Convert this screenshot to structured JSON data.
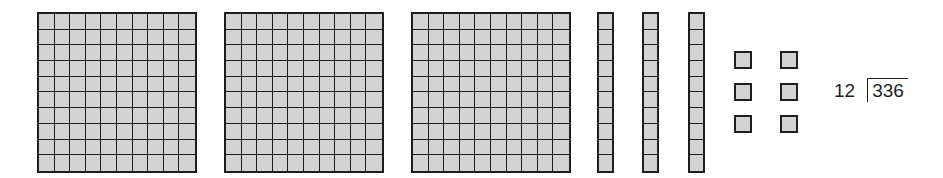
{
  "diagram": {
    "colors": {
      "block_fill": "#d3d3d3",
      "block_line": "#1e1e1e",
      "background": "#ffffff"
    },
    "base_ten_blocks": {
      "hundreds": {
        "count": 3,
        "grid": "10x10",
        "positions_x": [
          37,
          224,
          411
        ]
      },
      "tens": {
        "count": 3,
        "grid": "1x10",
        "positions_x": [
          597,
          642,
          688
        ]
      },
      "ones": {
        "count": 6,
        "layout": "3 rows x 2 columns",
        "positions": [
          {
            "x": 734,
            "y": 51
          },
          {
            "x": 780,
            "y": 51
          },
          {
            "x": 734,
            "y": 83
          },
          {
            "x": 780,
            "y": 83
          },
          {
            "x": 734,
            "y": 115
          },
          {
            "x": 780,
            "y": 115
          }
        ]
      },
      "total_value": 336
    },
    "division": {
      "divisor": "12",
      "dividend": "336"
    }
  }
}
